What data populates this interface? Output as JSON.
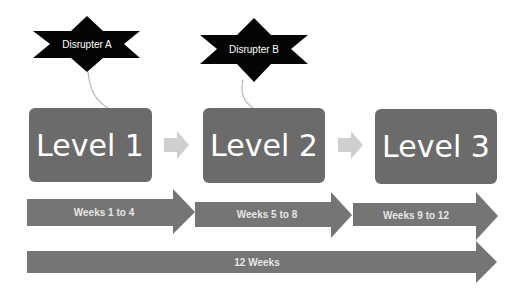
{
  "colors": {
    "background": "#ffffff",
    "star_fill": "#050505",
    "level_box_fill": "#6b6b6b",
    "small_arrow_fill": "#cfcfcf",
    "timeline_arrow_fill": "#757575",
    "connector_stroke": "#b5b5b5",
    "label_text": "#ffffff"
  },
  "disrupters": [
    {
      "label": "Disrupter A"
    },
    {
      "label": "Disrupter B"
    }
  ],
  "levels": [
    {
      "label": "Level 1"
    },
    {
      "label": "Level 2"
    },
    {
      "label": "Level 3"
    }
  ],
  "phases": [
    {
      "label": "Weeks 1 to 4"
    },
    {
      "label": "Weeks 5 to 8"
    },
    {
      "label": "Weeks 9 to 12"
    }
  ],
  "total": {
    "label": "12 Weeks"
  }
}
